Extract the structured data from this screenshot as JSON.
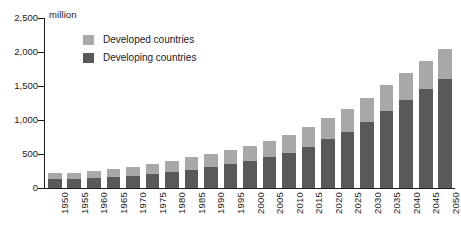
{
  "chart_data": {
    "type": "bar",
    "stacked": true,
    "title": "",
    "subtitle": "",
    "unit_label": "million",
    "xlabel": "",
    "ylabel": "",
    "ylim": [
      0,
      2500
    ],
    "ytick_labels": [
      "2,500",
      "2,000",
      "1,500",
      "1,000",
      "500",
      "0"
    ],
    "ytick_values": [
      2500,
      2000,
      1500,
      1000,
      500,
      0
    ],
    "grid": false,
    "legend_position": "upper-left-inside",
    "categories": [
      "1950",
      "1955",
      "1960",
      "1965",
      "1970",
      "1975",
      "1980",
      "1985",
      "1990",
      "1995",
      "2000",
      "2005",
      "2010",
      "2015",
      "2020",
      "2025",
      "2030",
      "2035",
      "2040",
      "2045",
      "2050"
    ],
    "series": [
      {
        "name": "Developing countries",
        "color": "#59595b",
        "values": [
          130,
          135,
          145,
          155,
          180,
          210,
          235,
          270,
          310,
          350,
          400,
          450,
          520,
          605,
          715,
          830,
          975,
          1135,
          1290,
          1450,
          1610
        ]
      },
      {
        "name": "Developed countries",
        "color": "#a8a8a8",
        "values": [
          85,
          90,
          100,
          120,
          135,
          150,
          165,
          180,
          195,
          210,
          225,
          245,
          265,
          290,
          310,
          330,
          350,
          375,
          400,
          420,
          435
        ]
      }
    ],
    "totals": [
      215,
      225,
      245,
      275,
      315,
      360,
      400,
      450,
      505,
      560,
      625,
      695,
      785,
      895,
      1025,
      1160,
      1325,
      1510,
      1690,
      1870,
      2045
    ]
  },
  "legend": {
    "items": [
      {
        "label": "Developed countries",
        "swatch_name": "legend-swatch-developed"
      },
      {
        "label": "Developing countries",
        "swatch_name": "legend-swatch-developing"
      }
    ]
  },
  "colors": {
    "developed": "#a8a8a8",
    "developing": "#59595b",
    "axis": "#1a1a1a",
    "background": "#ffffff"
  }
}
